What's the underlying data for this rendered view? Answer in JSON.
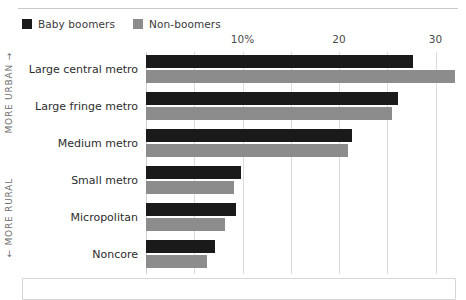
{
  "legend": {
    "entries": [
      {
        "label": "Baby boomers",
        "color": "#1a1a1a",
        "swatch_name": "legend-swatch-baby-boomers"
      },
      {
        "label": "Non-boomers",
        "color": "#8c8c8c",
        "swatch_name": "legend-swatch-non-boomers"
      }
    ]
  },
  "axis": {
    "ticklabels": [
      "10%",
      "20",
      "30"
    ],
    "side_note_top": "MORE URBAN →",
    "side_note_bottom": "← MORE RURAL"
  },
  "categories": {
    "0": "Large central metro",
    "1": "Large fringe metro",
    "2": "Medium metro",
    "3": "Small metro",
    "4": "Micropolitan",
    "5": "Noncore"
  },
  "chart_data": {
    "type": "bar",
    "orientation": "horizontal",
    "title": "",
    "subtitle": "",
    "xlabel": "",
    "ylabel": "",
    "xlim": [
      0,
      31.5
    ],
    "grid": true,
    "gridlines": [
      5,
      10,
      15,
      20,
      25,
      30
    ],
    "xticks": [
      10,
      20,
      30
    ],
    "xticklabels": [
      "10%",
      "20",
      "30"
    ],
    "legend_position": "top-left",
    "categories": [
      "Large central metro",
      "Large fringe metro",
      "Medium metro",
      "Small metro",
      "Micropolitan",
      "Noncore"
    ],
    "series": [
      {
        "name": "Baby boomers",
        "color": "#1a1a1a",
        "values": [
          27.7,
          26.1,
          21.3,
          9.8,
          9.3,
          7.1
        ]
      },
      {
        "name": "Non-boomers",
        "color": "#8c8c8c",
        "values": [
          32.0,
          25.5,
          20.9,
          9.1,
          8.2,
          6.3
        ]
      }
    ],
    "annotations": [
      "MORE URBAN →",
      "← MORE RURAL"
    ]
  }
}
